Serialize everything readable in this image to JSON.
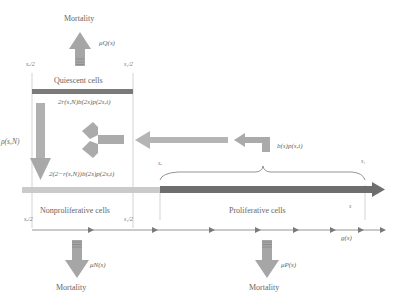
{
  "top": {
    "mortality_label": "Mortality",
    "mu_label": "μQ(s)"
  },
  "quiescent": {
    "label": "Quiescent cells",
    "left_bound": "sₒ/2",
    "right_bound": "s₁/2"
  },
  "flows": {
    "return_to_quiescent": "2r(s,N)b(2s)p(2s,t)",
    "to_nonproliferative": "2(2−r(s,N))b(2s)p(2s,t)",
    "activation": "ρ(s,N)",
    "division": "b(s)p(s,t)"
  },
  "proliferative": {
    "label": "Proliferative cells",
    "left_bound": "sₒ",
    "right_bound": "s₁",
    "axis_label": "s"
  },
  "nonproliferative": {
    "label": "Nonproliferative cells",
    "left_bound": "sₒ/2",
    "right_bound": "s₁/2"
  },
  "growth": {
    "label": "g(s)"
  },
  "bottom_left": {
    "mortality_label": "Mortality",
    "mu_label": "μN(s)"
  },
  "bottom_right": {
    "mortality_label": "Mortality",
    "mu_label": "μP(s)"
  },
  "colors": {
    "arrow_gray": "#a9a9a9",
    "bar_dark": "#6f6f6f",
    "bar_light": "#c9c9c9",
    "line": "#8a8a8a"
  }
}
